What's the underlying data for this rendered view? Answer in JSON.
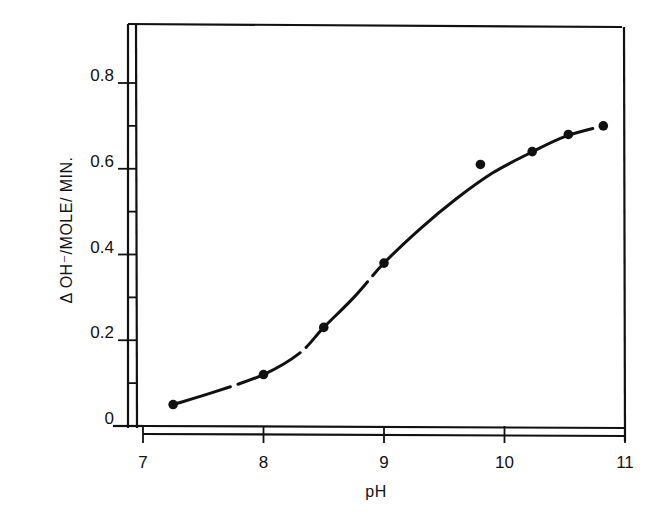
{
  "chart_data": {
    "type": "scatter",
    "title": "",
    "xlabel": "pH",
    "ylabel": "Δ OH⁻/MOLE/ MIN.",
    "xlim": [
      7,
      11
    ],
    "ylim": [
      0,
      0.9
    ],
    "x_ticks": [
      7,
      8,
      9,
      10,
      11
    ],
    "x_tick_labels": [
      "7",
      "8",
      "9",
      "10",
      "11"
    ],
    "y_ticks": [
      0,
      0.2,
      0.4,
      0.6,
      0.8
    ],
    "y_tick_labels": [
      "0",
      "0.2",
      "0.4",
      "0.6",
      "0.8"
    ],
    "y_minor_ticks": [
      0.1,
      0.3,
      0.5,
      0.7
    ],
    "grid": false,
    "legend": null,
    "series": [
      {
        "name": "measured",
        "style": "filled-circle-markers",
        "x": [
          7.25,
          8.0,
          8.5,
          9.0,
          9.8,
          10.23,
          10.53,
          10.82
        ],
        "y": [
          0.05,
          0.12,
          0.23,
          0.38,
          0.61,
          0.64,
          0.68,
          0.7
        ]
      },
      {
        "name": "fitted-curve",
        "style": "solid-smooth-line",
        "x": [
          7.25,
          7.6,
          8.0,
          8.3,
          8.5,
          8.75,
          9.0,
          9.3,
          9.6,
          9.9,
          10.2,
          10.5,
          10.82
        ],
        "y": [
          0.05,
          0.08,
          0.12,
          0.17,
          0.23,
          0.3,
          0.38,
          0.46,
          0.53,
          0.59,
          0.635,
          0.675,
          0.7
        ]
      }
    ]
  },
  "axes": {
    "x_label": "pH",
    "y_label": "Δ OH⁻/MOLE/ MIN."
  }
}
